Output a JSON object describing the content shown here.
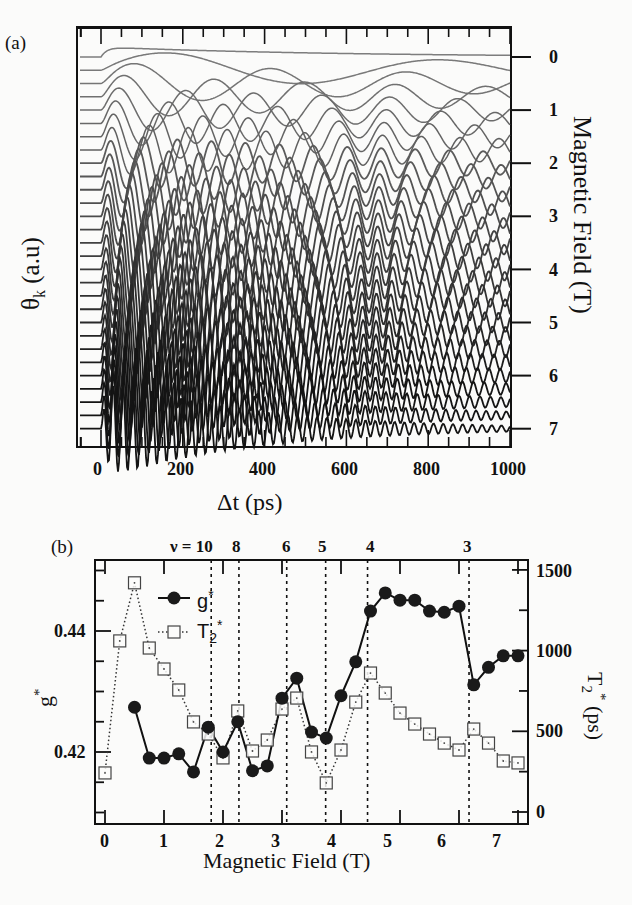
{
  "chart_data": [
    {
      "panel": "(a)",
      "type": "line",
      "title": "",
      "xlabel": "Δt (ps)",
      "ylabel": "θk (a.u)",
      "y2label": "Magnetic Field (T)",
      "xlim": [
        -60,
        1000
      ],
      "xticks": [
        0,
        200,
        400,
        600,
        800,
        1000
      ],
      "y2ticks": [
        0,
        1,
        2,
        3,
        4,
        5,
        6,
        7
      ],
      "grid": false,
      "description": "Waterfall of time-resolved Kerr rotation traces, one per magnetic field from 0 T to 7 T in 0.25 T steps, offset vertically; oscillation frequency increases and damping time decreases with field.",
      "series_fields_T": [
        0,
        0.25,
        0.5,
        0.75,
        1,
        1.25,
        1.5,
        1.75,
        2,
        2.25,
        2.5,
        2.75,
        3,
        3.25,
        3.5,
        3.75,
        4,
        4.25,
        4.5,
        4.75,
        5,
        5.25,
        5.5,
        5.75,
        6,
        6.25,
        6.5,
        6.75,
        7
      ]
    },
    {
      "panel": "(b)",
      "type": "scatter",
      "title": "",
      "xlabel": "Magnetic Field  (T)",
      "ylabel": "g*",
      "y2label": "T2* (ps)",
      "xlim": [
        -0.1,
        7.1
      ],
      "ylim": [
        0.408,
        0.4505
      ],
      "y2lim": [
        -35,
        1620
      ],
      "xticks": [
        0,
        1,
        2,
        3,
        4,
        5,
        6,
        7
      ],
      "yticks": [
        0.42,
        0.44
      ],
      "y2ticks": [
        0,
        500,
        1000,
        1500
      ],
      "grid": false,
      "legend_position": "upper-left",
      "filling_factor_lines": [
        {
          "label": "ν = 10",
          "B": 1.8
        },
        {
          "label": "8",
          "B": 2.27
        },
        {
          "label": "6",
          "B": 3.08
        },
        {
          "label": "5",
          "B": 3.74
        },
        {
          "label": "4",
          "B": 4.45
        },
        {
          "label": "3",
          "B": 6.17
        }
      ],
      "series": [
        {
          "name": "g*",
          "axis": "left",
          "marker": "filled-circle",
          "line": "solid",
          "x": [
            0.5,
            0.75,
            1.0,
            1.25,
            1.5,
            1.75,
            2.0,
            2.25,
            2.5,
            2.75,
            3.0,
            3.25,
            3.5,
            3.75,
            4.0,
            4.25,
            4.5,
            4.75,
            5.0,
            5.25,
            5.5,
            5.75,
            6.0,
            6.25,
            6.5,
            6.75,
            7.0
          ],
          "values": [
            0.4274,
            0.419,
            0.419,
            0.4197,
            0.4167,
            0.4241,
            0.42,
            0.425,
            0.4169,
            0.4177,
            0.4289,
            0.4322,
            0.4233,
            0.4223,
            0.4293,
            0.4349,
            0.4433,
            0.4463,
            0.4451,
            0.4451,
            0.4433,
            0.4431,
            0.4441,
            0.4311,
            0.434,
            0.4359,
            0.4359
          ]
        },
        {
          "name": "T2*",
          "axis": "right",
          "marker": "open-square",
          "line": "dotted",
          "x": [
            0,
            0.25,
            0.5,
            0.75,
            1.0,
            1.25,
            1.5,
            1.75,
            2.0,
            2.25,
            2.5,
            2.75,
            3.0,
            3.25,
            3.5,
            3.75,
            4.0,
            4.25,
            4.5,
            4.75,
            5.0,
            5.25,
            5.5,
            5.75,
            6.0,
            6.25,
            6.5,
            6.75,
            7.0
          ],
          "values": [
            242,
            1060,
            1420,
            1016,
            886,
            756,
            558,
            483,
            335,
            626,
            378,
            446,
            638,
            706,
            372,
            180,
            384,
            681,
            861,
            737,
            613,
            545,
            483,
            427,
            384,
            514,
            427,
            316,
            304
          ]
        }
      ]
    }
  ],
  "labels": {
    "panel_a": "(a)",
    "panel_b": "(b)",
    "a_xlabel": "Δt (ps)",
    "a_ylabel_main": "θ",
    "a_ylabel_sub": "k",
    "a_ylabel_rest": " (a.u)",
    "a_y2label": "Magnetic Field (T)",
    "b_xlabel": "Magnetic Field  (T)",
    "b_ylabel": "g",
    "b_ylabel_sup": "*",
    "b_y2label_main": "T",
    "b_y2label_sub": "2",
    "b_y2label_sup": "*",
    "b_y2label_rest": " (ps)",
    "legend_g": "g",
    "legend_g_sup": "*",
    "legend_t": "T",
    "legend_t_sub": "2",
    "legend_t_sup": "*",
    "a_xticks": [
      "0",
      "200",
      "400",
      "600",
      "800",
      "1000"
    ],
    "a_y2ticks": [
      "0",
      "1",
      "2",
      "3",
      "4",
      "5",
      "6",
      "7"
    ],
    "b_xticks": [
      "0",
      "1",
      "2",
      "3",
      "4",
      "5",
      "6",
      "7"
    ],
    "b_yticks": [
      "0.44",
      "0.42"
    ],
    "b_y2ticks": [
      "1500",
      "1000",
      "500",
      "0"
    ],
    "nu_labels": [
      "ν = 10",
      "8",
      "6",
      "5",
      "4",
      "3"
    ]
  },
  "colors": {
    "ink": "#111111",
    "trace_light": "#7a7a7a",
    "trace_dark": "#1a1a1a",
    "background": "#fbfbfa"
  }
}
